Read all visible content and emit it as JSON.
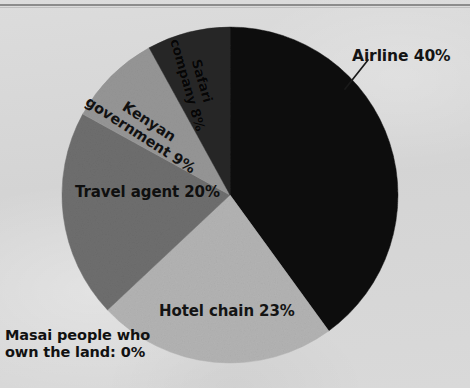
{
  "page": {
    "background_color": "#d6d6d6",
    "rule_color": "#8c8c8c"
  },
  "chart_data": {
    "type": "pie",
    "title": "",
    "subtitle": "",
    "xlabel": "",
    "ylabel": "",
    "legend_position": "none",
    "grid": false,
    "start_angle_deg": 0,
    "direction": "clockwise",
    "center": {
      "x": 230,
      "y": 195
    },
    "radius": 168,
    "total": 100,
    "units": "%",
    "categories": [
      "Airline",
      "Hotel chain",
      "Travel agent",
      "Kenyan government",
      "Safari company",
      "Masai people who own the land"
    ],
    "values": [
      40,
      23,
      20,
      9,
      8,
      0
    ],
    "colors": [
      "#0d0d0d",
      "#b3b3b3",
      "#6e6e6e",
      "#969696",
      "#272727",
      "#d6d6d6"
    ],
    "slices": [
      {
        "name": "airline",
        "label": "Airline 40%",
        "category": "Airline",
        "value": 40,
        "color": "#0d0d0d",
        "start_deg": 0,
        "end_deg": 144,
        "label_placement": "outside",
        "leader_line": true
      },
      {
        "name": "hotel-chain",
        "label": "Hotel chain 23%",
        "category": "Hotel chain",
        "value": 23,
        "color": "#b3b3b3",
        "start_deg": 144,
        "end_deg": 226.8,
        "label_placement": "inside",
        "leader_line": false
      },
      {
        "name": "travel-agent",
        "label": "Travel agent 20%",
        "category": "Travel agent",
        "value": 20,
        "color": "#6e6e6e",
        "start_deg": 226.8,
        "end_deg": 298.8,
        "label_placement": "inside",
        "leader_line": false
      },
      {
        "name": "kenyan-government",
        "label_line1": "Kenyan",
        "label_line2": "government 9%",
        "category": "Kenyan government",
        "value": 9,
        "color": "#969696",
        "start_deg": 298.8,
        "end_deg": 331.2,
        "label_placement": "inside-rotated",
        "rotation_deg": 33,
        "leader_line": false
      },
      {
        "name": "safari-company",
        "label_line1": "Safari",
        "label_line2": "company 8%",
        "category": "Safari company",
        "value": 8,
        "color": "#272727",
        "start_deg": 331.2,
        "end_deg": 360,
        "label_placement": "inside-rotated",
        "rotation_deg": 74,
        "leader_line": false
      },
      {
        "name": "masai-people",
        "label_line1": "Masai people who",
        "label_line2": "own the land: 0%",
        "category": "Masai people who own the land",
        "value": 0,
        "color": "#d6d6d6",
        "start_deg": 360,
        "end_deg": 360,
        "label_placement": "outside",
        "leader_line": false
      }
    ]
  },
  "labels": {
    "airline": "Airline 40%",
    "hotel_chain": "Hotel chain 23%",
    "travel_agent": "Travel agent 20%",
    "kenyan_government_line1": "Kenyan",
    "kenyan_government_line2": "government 9%",
    "safari_company_line1": "Safari",
    "safari_company_line2": "company 8%",
    "masai_line1": "Masai people who",
    "masai_line2": "own the land: 0%"
  }
}
